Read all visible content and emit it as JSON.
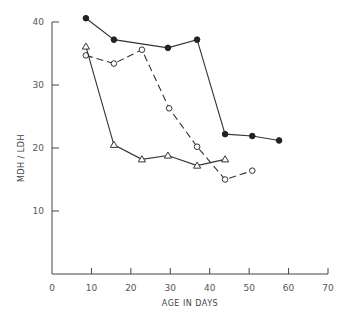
{
  "chart_data": {
    "type": "line",
    "title": "",
    "xlabel": "AGE IN DAYS",
    "ylabel": "MDH / LDH",
    "xlim": [
      0,
      70
    ],
    "ylim": [
      0,
      40
    ],
    "xticks": [
      0,
      10,
      20,
      30,
      40,
      50,
      60,
      70
    ],
    "yticks": [
      10,
      20,
      30,
      40
    ],
    "grid": false,
    "legend": null,
    "series": [
      {
        "name": "filled circles (solid line)",
        "marker": "filled-circle",
        "line": "solid",
        "x": [
          8.6,
          15.7,
          29.4,
          36.8,
          43.9,
          50.8,
          57.6
        ],
        "y": [
          40.6,
          37.2,
          35.9,
          37.2,
          22.2,
          21.9,
          21.2
        ]
      },
      {
        "name": "open circles (dashed line)",
        "marker": "open-circle",
        "line": "dashed",
        "x": [
          8.6,
          15.7,
          22.8,
          29.7,
          36.8,
          43.9,
          50.8
        ],
        "y": [
          34.7,
          33.4,
          35.6,
          26.3,
          20.2,
          15.0,
          16.4
        ]
      },
      {
        "name": "open triangles (solid line)",
        "marker": "open-triangle",
        "line": "solid",
        "x": [
          8.6,
          15.7,
          22.8,
          29.4,
          36.8,
          43.9
        ],
        "y": [
          36.1,
          20.5,
          18.2,
          18.8,
          17.2,
          18.2
        ]
      }
    ]
  }
}
